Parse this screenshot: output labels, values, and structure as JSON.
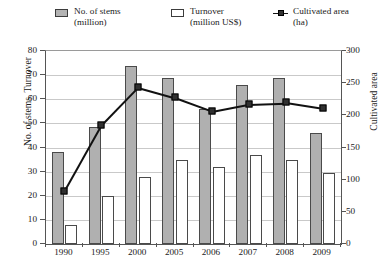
{
  "legend": {
    "items": [
      {
        "name": "stems",
        "line1": "No. of stems",
        "line2": "(million)",
        "swatch": "grey-filled-rect-icon"
      },
      {
        "name": "turnover",
        "line1": "Turnover",
        "line2": "(million US$)",
        "swatch": "white-outlined-rect-icon"
      },
      {
        "name": "cultivated-area",
        "line1": "Cultivated area",
        "line2": "(ha)",
        "swatch": "line-marker-icon"
      }
    ]
  },
  "axes": {
    "left_title": "No. of stems, Turnover",
    "right_title": "Cultivated area",
    "left_ticks": [
      "0",
      "10",
      "20",
      "30",
      "40",
      "50",
      "60",
      "70",
      "80"
    ],
    "right_ticks": [
      "0",
      "50",
      "100",
      "150",
      "200",
      "250",
      "300"
    ]
  },
  "colors": {
    "stems_fill": "#b0b0b0",
    "turnover_fill": "#ffffff",
    "bar_stroke": "#4a4a4a",
    "line": "#111111",
    "marker": "#303030",
    "grid": "#c9c9c9",
    "axis": "#555555",
    "text": "#1a1a1a",
    "background": "#ffffff"
  },
  "chart_data": {
    "type": "bar",
    "title": "",
    "subtitle": "",
    "xlabel": "",
    "ylabel": "No. of stems, Turnover",
    "y2label": "Cultivated area",
    "categories": [
      "1990",
      "1995",
      "2000",
      "2005",
      "2006",
      "2007",
      "2008",
      "2009"
    ],
    "ylim": [
      0,
      80
    ],
    "y2lim": [
      0,
      300
    ],
    "yticks": [
      0,
      10,
      20,
      30,
      40,
      50,
      60,
      70,
      80
    ],
    "y2ticks": [
      0,
      50,
      100,
      150,
      200,
      250,
      300
    ],
    "grid": true,
    "legend_position": "top",
    "series": [
      {
        "name": "No. of stems (million)",
        "type": "bar",
        "axis": "left",
        "values": [
          38,
          48.5,
          74,
          69,
          56,
          66,
          69,
          46
        ]
      },
      {
        "name": "Turnover (million US$)",
        "type": "bar",
        "axis": "left",
        "values": [
          8,
          20,
          28,
          35,
          32,
          37,
          35,
          29.5
        ]
      },
      {
        "name": "Cultivated area (ha)",
        "type": "line",
        "axis": "right",
        "values": [
          83,
          185,
          244,
          228,
          207,
          218,
          220,
          211
        ]
      }
    ]
  }
}
